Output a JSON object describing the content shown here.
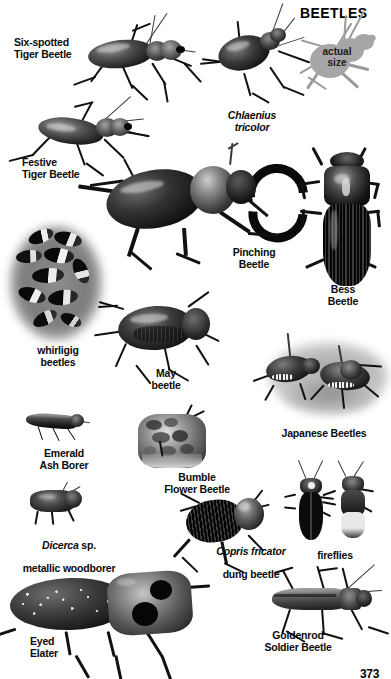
{
  "page": {
    "title": "BEETLES",
    "page_number": "373",
    "background_color": "#ffffff",
    "text_color": "#0b0b0b"
  },
  "scale_note": {
    "text": "actual\nsize",
    "silhouette_color": "#a6a6a6"
  },
  "specimens": [
    {
      "id": "six-spotted-tiger-beetle",
      "label": "Six-spotted\nTiger Beetle",
      "italic": false,
      "align": "left"
    },
    {
      "id": "festive-tiger-beetle",
      "label": "Festive\nTiger Beetle",
      "italic": false,
      "align": "left"
    },
    {
      "id": "chlaenius-tricolor",
      "label": "Chlaenius\ntricolor",
      "italic": true,
      "align": "center"
    },
    {
      "id": "pinching-beetle",
      "label": "Pinching\nBeetle",
      "italic": false,
      "align": "center"
    },
    {
      "id": "bess-beetle",
      "label": "Bess\nBeetle",
      "italic": false,
      "align": "center"
    },
    {
      "id": "whirligig-beetles",
      "label": "whirligig\nbeetles",
      "italic": false,
      "align": "center"
    },
    {
      "id": "may-beetle",
      "label": "May\nbeetle",
      "italic": false,
      "align": "center"
    },
    {
      "id": "japanese-beetles",
      "label": "Japanese Beetles",
      "italic": false,
      "align": "center"
    },
    {
      "id": "emerald-ash-borer",
      "label": "Emerald\nAsh Borer",
      "italic": false,
      "align": "center"
    },
    {
      "id": "bumble-flower-beetle",
      "label": "Bumble\nFlower Beetle",
      "italic": false,
      "align": "center"
    },
    {
      "id": "dicerca-metallic-woodborer",
      "label_italic": "Dicerca",
      "label_roman": " sp.",
      "label_line2": "metallic woodborer",
      "italic": true,
      "align": "center"
    },
    {
      "id": "copris-fricator-dung-beetle",
      "label_italic": "Copris fricator",
      "label_line2": "dung beetle",
      "italic": true,
      "align": "center"
    },
    {
      "id": "fireflies",
      "label": "fireflies",
      "italic": false,
      "align": "center"
    },
    {
      "id": "eyed-elater",
      "label": "Eyed\nElater",
      "italic": false,
      "align": "left"
    },
    {
      "id": "goldenrod-soldier-beetle",
      "label": "Goldenrod\nSoldier Beetle",
      "italic": false,
      "align": "center"
    }
  ]
}
